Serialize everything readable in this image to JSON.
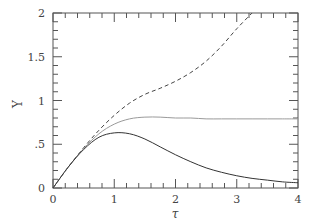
{
  "chart_data": {
    "type": "line",
    "title": "",
    "xlabel": "τ",
    "ylabel": "Y",
    "xlim": [
      0,
      4
    ],
    "ylim": [
      0,
      2
    ],
    "grid": false,
    "legend": null,
    "x_ticks": [
      "0",
      "1",
      "2",
      "3",
      "4"
    ],
    "y_ticks": [
      "0",
      ".5",
      "1",
      "1.5",
      "2"
    ],
    "x": [
      0,
      0.25,
      0.5,
      0.75,
      1.0,
      1.25,
      1.5,
      1.75,
      2.0,
      2.25,
      2.5,
      2.75,
      3.0,
      3.25,
      3.5,
      3.75,
      4.0
    ],
    "series": [
      {
        "name": "dashed",
        "style": "dashed",
        "color": "#444444",
        "values": [
          0,
          0.24,
          0.46,
          0.66,
          0.83,
          0.97,
          1.07,
          1.14,
          1.22,
          1.32,
          1.45,
          1.62,
          1.82,
          2.02,
          null,
          null,
          null
        ]
      },
      {
        "name": "gray",
        "style": "solid-light",
        "color": "#9a9a9a",
        "values": [
          0,
          0.24,
          0.45,
          0.62,
          0.73,
          0.79,
          0.81,
          0.81,
          0.8,
          0.8,
          0.79,
          0.79,
          0.79,
          0.79,
          0.79,
          0.79,
          0.79
        ]
      },
      {
        "name": "solid",
        "style": "solid",
        "color": "#333333",
        "values": [
          0,
          0.24,
          0.44,
          0.58,
          0.63,
          0.62,
          0.56,
          0.47,
          0.38,
          0.3,
          0.23,
          0.18,
          0.14,
          0.11,
          0.09,
          0.07,
          0.06
        ]
      }
    ]
  },
  "axes": {
    "xlabel": "τ",
    "ylabel": "Y",
    "x_ticks": [
      {
        "label": "0",
        "value": 0
      },
      {
        "label": "1",
        "value": 1
      },
      {
        "label": "2",
        "value": 2
      },
      {
        "label": "3",
        "value": 3
      },
      {
        "label": "4",
        "value": 4
      }
    ],
    "y_ticks": [
      {
        "label": "0",
        "value": 0
      },
      {
        "label": ".5",
        "value": 0.5
      },
      {
        "label": "1",
        "value": 1
      },
      {
        "label": "1.5",
        "value": 1.5
      },
      {
        "label": "2",
        "value": 2
      }
    ]
  }
}
